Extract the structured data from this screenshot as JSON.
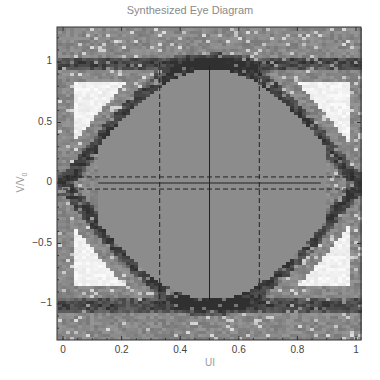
{
  "chart_data": {
    "type": "heatmap",
    "title": "Synthesized Eye Diagram",
    "xlabel": "UI",
    "ylabel": "V/V0",
    "xlim": [
      -0.02,
      1.02
    ],
    "ylim": [
      -1.3,
      1.3
    ],
    "xticks": [
      0,
      0.2,
      0.4,
      0.6,
      0.8,
      1
    ],
    "xtick_labels": [
      "0",
      "0.2",
      "0.4",
      "0.6",
      "0.8",
      "1"
    ],
    "yticks": [
      1,
      0.5,
      0,
      -0.5,
      -1
    ],
    "ytick_labels": [
      "1",
      "0.5",
      "0",
      "−0.5",
      "−1"
    ],
    "grid": false,
    "colormap": "grayscale density",
    "eye": {
      "crossing_points_ui": [
        0.0,
        1.0
      ],
      "eye_center_ui": 0.5,
      "high_level": 1.0,
      "low_level": -1.0,
      "eye_height_bounds": [
        0.97,
        -0.97
      ],
      "eye_width_markers_ui": [
        0.33,
        0.67
      ]
    },
    "overlay_lines": [
      {
        "style": "solid",
        "orientation": "vertical",
        "x": 0.5,
        "y_range": [
          -0.97,
          0.97
        ]
      },
      {
        "style": "dashed",
        "orientation": "vertical",
        "x": 0.33,
        "y_range": [
          -1.0,
          1.0
        ]
      },
      {
        "style": "dashed",
        "orientation": "vertical",
        "x": 0.67,
        "y_range": [
          -1.0,
          1.0
        ]
      },
      {
        "style": "dashed",
        "orientation": "horizontal",
        "y": 0.05,
        "x_range": [
          0,
          1
        ]
      },
      {
        "style": "dashed",
        "orientation": "horizontal",
        "y": -0.05,
        "x_range": [
          0,
          1
        ]
      },
      {
        "style": "solid",
        "orientation": "horizontal",
        "y": 0.0,
        "x_range": [
          0.12,
          0.88
        ]
      }
    ]
  },
  "labels": {
    "title": "Synthesized Eye Diagram",
    "xlabel": "UI",
    "ylabel_main": "V/V",
    "ylabel_sub": "0"
  }
}
